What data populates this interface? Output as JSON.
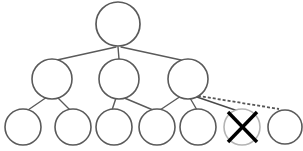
{
  "diagram": {
    "type": "node-link-tree",
    "canvas": {
      "width": 303,
      "height": 151,
      "background": "#ffffff"
    },
    "colors": {
      "node_stroke": "#5a5a5a",
      "node_fill": "#ffffff",
      "faded_node_stroke": "#b4b4b4",
      "edge_solid": "#5a5a5a",
      "edge_dashed": "#555555",
      "cross_mark": "#000000"
    },
    "stroke_widths": {
      "node": 1.6,
      "faded_node": 1.6,
      "edge_solid": 1.4,
      "edge_dashed": 1.6,
      "cross_mark": 3.4
    },
    "dash_pattern": "3 2",
    "nodes": [
      {
        "id": "root",
        "label": "",
        "level": 0,
        "cx": 118,
        "cy": 24,
        "r": 22,
        "state": "normal"
      },
      {
        "id": "n1",
        "label": "",
        "level": 1,
        "cx": 52,
        "cy": 79,
        "r": 20,
        "state": "normal"
      },
      {
        "id": "n2",
        "label": "",
        "level": 1,
        "cx": 119,
        "cy": 79,
        "r": 20,
        "state": "normal"
      },
      {
        "id": "n3",
        "label": "",
        "level": 1,
        "cx": 188,
        "cy": 79,
        "r": 20,
        "state": "normal"
      },
      {
        "id": "l1",
        "label": "",
        "level": 2,
        "cx": 23,
        "cy": 127,
        "r": 18,
        "state": "normal"
      },
      {
        "id": "l2",
        "label": "",
        "level": 2,
        "cx": 73,
        "cy": 127,
        "r": 18,
        "state": "normal"
      },
      {
        "id": "l3",
        "label": "",
        "level": 2,
        "cx": 114,
        "cy": 127,
        "r": 18,
        "state": "normal"
      },
      {
        "id": "l4",
        "label": "",
        "level": 2,
        "cx": 157,
        "cy": 127,
        "r": 18,
        "state": "normal"
      },
      {
        "id": "l5",
        "label": "",
        "level": 2,
        "cx": 198,
        "cy": 127,
        "r": 18,
        "state": "normal"
      },
      {
        "id": "lx",
        "label": "",
        "level": 2,
        "cx": 242,
        "cy": 127,
        "r": 18,
        "state": "crossed-out"
      },
      {
        "id": "l7",
        "label": "",
        "level": 2,
        "cx": 285,
        "cy": 127,
        "r": 17,
        "state": "normal"
      }
    ],
    "edges": [
      {
        "id": "e-root-n1",
        "from": "root",
        "to": "n1",
        "style": "solid",
        "x1": 116,
        "y1": 47,
        "x2": 57,
        "y2": 60
      },
      {
        "id": "e-root-n2",
        "from": "root",
        "to": "n2",
        "style": "solid",
        "x1": 118,
        "y1": 47,
        "x2": 119,
        "y2": 59
      },
      {
        "id": "e-root-n3",
        "from": "root",
        "to": "n3",
        "style": "solid",
        "x1": 121,
        "y1": 47,
        "x2": 181,
        "y2": 60
      },
      {
        "id": "e-n1-l1",
        "from": "n1",
        "to": "l1",
        "style": "solid",
        "x1": 47,
        "y1": 97,
        "x2": 28,
        "y2": 110
      },
      {
        "id": "e-n1-l2",
        "from": "n1",
        "to": "l2",
        "style": "solid",
        "x1": 57,
        "y1": 97,
        "x2": 70,
        "y2": 110
      },
      {
        "id": "e-n2-l3",
        "from": "n2",
        "to": "l3",
        "style": "solid",
        "x1": 116,
        "y1": 98,
        "x2": 112,
        "y2": 110
      },
      {
        "id": "e-n2-l4",
        "from": "n2",
        "to": "l4",
        "style": "solid",
        "x1": 122,
        "y1": 97,
        "x2": 153,
        "y2": 110
      },
      {
        "id": "e-n3-l4",
        "from": "n3",
        "to": "l4",
        "style": "solid",
        "x1": 181,
        "y1": 96,
        "x2": 160,
        "y2": 110
      },
      {
        "id": "e-n3-l5",
        "from": "n3",
        "to": "l5",
        "style": "solid",
        "x1": 190,
        "y1": 98,
        "x2": 197,
        "y2": 110
      },
      {
        "id": "e-n3-lx",
        "from": "n3",
        "to": "lx",
        "style": "solid",
        "x1": 194,
        "y1": 96,
        "x2": 238,
        "y2": 111
      },
      {
        "id": "e-n3-l7",
        "from": "n3",
        "to": "l7",
        "style": "dashed",
        "x1": 193,
        "y1": 95,
        "x2": 279,
        "y2": 109
      }
    ],
    "cross_mark": {
      "node": "lx",
      "x1": 228,
      "y1": 112,
      "x2": 257,
      "y2": 142,
      "x3": 257,
      "y3": 112,
      "x4": 228,
      "y4": 142
    },
    "legend": {
      "solid_edge": "existing link",
      "dashed_edge": "new link",
      "crossed_node": "removed node"
    }
  }
}
